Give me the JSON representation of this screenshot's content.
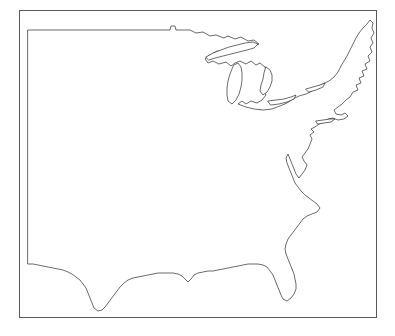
{
  "figure": {
    "title": "",
    "kind": "map",
    "background_color": "#ffffff"
  },
  "frame": {
    "border_color": "#595959",
    "border_width_px": 1,
    "x": 19,
    "y": 10,
    "width": 358,
    "height": 308
  },
  "map": {
    "region_label": "Eastern and Central United States",
    "coastline_color": "#2b2b2b",
    "land_fill": "#ffffff",
    "lakes": [
      "Lake Superior",
      "Lake Michigan",
      "Lake Huron",
      "Lake Erie",
      "Lake Ontario"
    ],
    "named_features": [
      "Maine",
      "Cape Cod",
      "Long Island",
      "Chesapeake Bay",
      "Delmarva Peninsula",
      "Florida Peninsula",
      "Mississippi Delta",
      "Texas Gulf Coast",
      "Upper Peninsula of Michigan",
      "Lower Peninsula of Michigan"
    ]
  },
  "grid": {
    "line_color": "#6e6e6e",
    "line_width_px": 0.45,
    "cell_width_px": 16.0,
    "cell_height_px": 14.5,
    "columns": 20,
    "rows": 18,
    "origin_x": 8,
    "origin_y": 19,
    "dot_color": "#1a1a1a",
    "dot_radius_px": 1.0,
    "dot_label": "grid cell center point"
  },
  "chart_data": {
    "type": "map",
    "title": "",
    "xlabel": "",
    "ylabel": "",
    "grid": true,
    "legend": "none",
    "cell_count_columns": 20,
    "cell_count_rows": 18,
    "marker": "center dot per grid cell",
    "coverage": "contiguous eastern and central United States east of approximately 105W"
  }
}
